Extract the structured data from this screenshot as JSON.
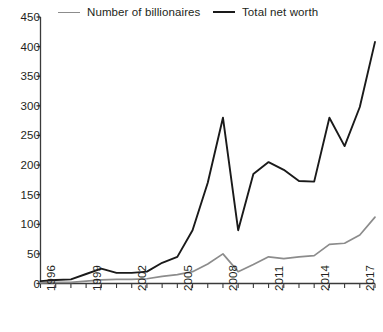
{
  "chart_data": {
    "type": "line",
    "title": "",
    "subtitle": "",
    "xlabel": "",
    "ylabel": "",
    "xlim": [
      1996,
      2018
    ],
    "ylim": [
      0,
      450
    ],
    "yticks": [
      0,
      50,
      100,
      150,
      200,
      250,
      300,
      350,
      400,
      450
    ],
    "xticks": [
      1996,
      1997,
      1998,
      1999,
      2000,
      2001,
      2002,
      2003,
      2004,
      2005,
      2006,
      2007,
      2008,
      2009,
      2010,
      2011,
      2012,
      2013,
      2014,
      2015,
      2016,
      2017,
      2018
    ],
    "xtick_labels_shown": [
      "1996",
      "1999",
      "2002",
      "2005",
      "2008",
      "2011",
      "2014",
      "2017"
    ],
    "grid": false,
    "legend_position": "top",
    "x": [
      1996,
      1997,
      1998,
      1999,
      2000,
      2001,
      2002,
      2003,
      2004,
      2005,
      2006,
      2007,
      2008,
      2009,
      2010,
      2011,
      2012,
      2013,
      2014,
      2015,
      2016,
      2017,
      2018
    ],
    "series": [
      {
        "name": "Number of billionaires",
        "color": "#8c8c8c",
        "values": [
          1,
          2,
          2,
          4,
          6,
          7,
          7,
          8,
          12,
          15,
          20,
          33,
          50,
          20,
          32,
          45,
          42,
          45,
          47,
          66,
          68,
          82,
          112
        ]
      },
      {
        "name": "Total net worth",
        "color": "#1a1a1a",
        "values": [
          4,
          6,
          7,
          16,
          25,
          18,
          18,
          20,
          35,
          45,
          90,
          170,
          280,
          90,
          185,
          205,
          192,
          173,
          172,
          280,
          232,
          298,
          408
        ]
      }
    ]
  },
  "legend": {
    "items": [
      {
        "label": "Number of billionaires",
        "color": "#8c8c8c"
      },
      {
        "label": "Total net worth",
        "color": "#1a1a1a"
      }
    ]
  },
  "axis": {
    "y_tick_labels": [
      "450",
      "400",
      "350",
      "300",
      "250",
      "200",
      "150",
      "100",
      "50",
      "0"
    ],
    "x_tick_labels": [
      "1996",
      "1999",
      "2002",
      "2005",
      "2008",
      "2011",
      "2014",
      "2017"
    ]
  }
}
